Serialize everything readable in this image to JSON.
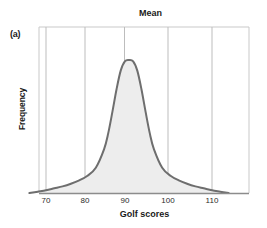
{
  "figure": {
    "panel_label": "(a)",
    "title": "Mean",
    "background": "#ffffff"
  },
  "axes": {
    "x_label": "Golf scores",
    "y_label": "Frequency",
    "x_ticks": [
      "70",
      "80",
      "90",
      "100",
      "110"
    ],
    "y_ticks": [],
    "border_color": "#c9c9c9",
    "gridline_color": "#b8b8b8",
    "baseline_color": "#8c8c8c"
  },
  "chart_data": {
    "type": "area",
    "title": "Mean",
    "xlabel": "Golf scores",
    "ylabel": "Frequency",
    "xlim": [
      66,
      114
    ],
    "ylim": [
      0,
      1
    ],
    "grid": true,
    "legend": "none",
    "tick_labels": [
      "70",
      "80",
      "90",
      "100",
      "110"
    ],
    "tick_values": [
      70,
      80,
      90,
      100,
      110
    ],
    "annotations": [
      {
        "text": "Mean",
        "x": 90,
        "note": "vertical gridline at the mean, labelled above the plot"
      },
      {
        "text": "(a)",
        "note": "panel identifier, top-left outside plot area"
      }
    ],
    "series": [
      {
        "name": "Golf score distribution",
        "description": "Unimodal symmetric leptokurtic (peaked, heavy-tailed) frequency curve centered on the mean of 90",
        "fill_color": "#ededed",
        "line_color": "#6e6e6e",
        "line_width": 2,
        "x": [
          66,
          68,
          70,
          72,
          74,
          76,
          78,
          80,
          82,
          84,
          85,
          86,
          87,
          88,
          89,
          90,
          91,
          92,
          93,
          94,
          95,
          96,
          98,
          100,
          102,
          104,
          106,
          108,
          110,
          112,
          114
        ],
        "y": [
          0.0,
          0.01,
          0.02,
          0.035,
          0.05,
          0.07,
          0.095,
          0.13,
          0.19,
          0.33,
          0.45,
          0.61,
          0.78,
          0.92,
          0.99,
          1.0,
          0.99,
          0.92,
          0.78,
          0.61,
          0.45,
          0.33,
          0.19,
          0.13,
          0.095,
          0.07,
          0.05,
          0.035,
          0.02,
          0.01,
          0.0
        ]
      }
    ]
  }
}
